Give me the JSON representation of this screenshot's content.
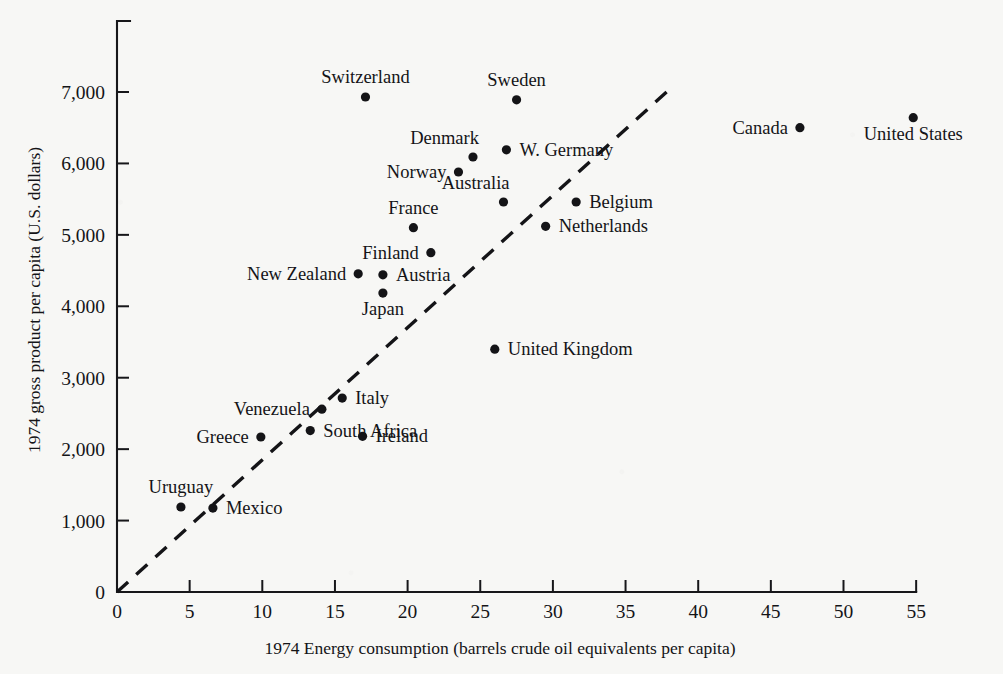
{
  "chart_data": {
    "type": "scatter",
    "title": "",
    "xlabel": "1974 Energy consumption (barrels crude oil equivalents per capita)",
    "ylabel": "1974 gross product per capita (U.S. dollars)",
    "xlim": [
      0,
      55
    ],
    "ylim": [
      0,
      7700
    ],
    "grid": false,
    "legend": "none",
    "xticks": [
      "0",
      "5",
      "10",
      "15",
      "20",
      "25",
      "30",
      "35",
      "40",
      "45",
      "50",
      "55"
    ],
    "xtick_values": [
      0,
      5,
      10,
      15,
      20,
      25,
      30,
      35,
      40,
      45,
      50,
      55
    ],
    "yticks": [
      "0",
      "1,000",
      "2,000",
      "3,000",
      "4,000",
      "5,000",
      "6,000",
      "7,000"
    ],
    "ytick_values": [
      0,
      1000,
      2000,
      3000,
      4000,
      5000,
      6000,
      7000
    ],
    "annotations": [
      {
        "name": "trend-line",
        "type": "dashed-reference-line",
        "from": [
          0,
          0
        ],
        "to": [
          38.2,
          7070
        ]
      }
    ],
    "points": [
      {
        "label": "Switzerland",
        "x": 17.1,
        "y": 6930,
        "label_pos": "above"
      },
      {
        "label": "Sweden",
        "x": 27.5,
        "y": 6890,
        "label_pos": "above"
      },
      {
        "label": "Canada",
        "x": 47.0,
        "y": 6500,
        "label_pos": "left"
      },
      {
        "label": "United States",
        "x": 54.8,
        "y": 6640,
        "label_pos": "below"
      },
      {
        "label": "Denmark",
        "x": 24.5,
        "y": 6090,
        "label_pos": "above-left"
      },
      {
        "label": "W. Germany",
        "x": 26.8,
        "y": 6190,
        "label_pos": "right"
      },
      {
        "label": "Norway",
        "x": 23.5,
        "y": 5880,
        "label_pos": "left"
      },
      {
        "label": "Australia",
        "x": 26.6,
        "y": 5460,
        "label_pos": "above-left"
      },
      {
        "label": "Belgium",
        "x": 31.6,
        "y": 5460,
        "label_pos": "right"
      },
      {
        "label": "Netherlands",
        "x": 29.5,
        "y": 5120,
        "label_pos": "right"
      },
      {
        "label": "France",
        "x": 20.4,
        "y": 5100,
        "label_pos": "above"
      },
      {
        "label": "Finland",
        "x": 21.6,
        "y": 4750,
        "label_pos": "left"
      },
      {
        "label": "New Zealand",
        "x": 16.6,
        "y": 4455,
        "label_pos": "left"
      },
      {
        "label": "Austria",
        "x": 18.3,
        "y": 4440,
        "label_pos": "right"
      },
      {
        "label": "Japan",
        "x": 18.3,
        "y": 4185,
        "label_pos": "below"
      },
      {
        "label": "United Kingdom",
        "x": 26.0,
        "y": 3400,
        "label_pos": "right"
      },
      {
        "label": "Italy",
        "x": 15.5,
        "y": 2715,
        "label_pos": "right"
      },
      {
        "label": "Venezuela",
        "x": 14.1,
        "y": 2560,
        "label_pos": "left"
      },
      {
        "label": "Ireland",
        "x": 16.9,
        "y": 2180,
        "label_pos": "right"
      },
      {
        "label": "Greece",
        "x": 9.9,
        "y": 2170,
        "label_pos": "left"
      },
      {
        "label": "South Africa",
        "x": 13.3,
        "y": 2260,
        "label_pos": "right"
      },
      {
        "label": "Uruguay",
        "x": 4.4,
        "y": 1190,
        "label_pos": "above"
      },
      {
        "label": "Mexico",
        "x": 6.6,
        "y": 1175,
        "label_pos": "right"
      }
    ]
  }
}
